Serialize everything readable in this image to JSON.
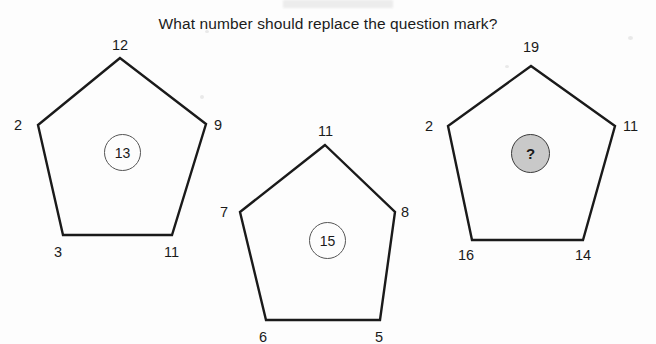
{
  "title": "What number should replace the question mark?",
  "colors": {
    "background": "#fdfdfd",
    "stroke": "#1a1a1a",
    "question_fill": "#c9c9c9",
    "text": "#1a1a1a"
  },
  "puzzle": {
    "type": "pentagon-number-puzzle",
    "shape_count": 3,
    "shapes": [
      {
        "name": "pentagon-1",
        "center_value": "13",
        "center_is_question": false,
        "vertices": {
          "top": "12",
          "left": "2",
          "right": "9",
          "bottom_left": "3",
          "bottom_right": "11"
        }
      },
      {
        "name": "pentagon-2",
        "center_value": "15",
        "center_is_question": false,
        "vertices": {
          "top": "11",
          "left": "7",
          "right": "8",
          "bottom_left": "6",
          "bottom_right": "5"
        }
      },
      {
        "name": "pentagon-3",
        "center_value": "?",
        "center_is_question": true,
        "vertices": {
          "top": "19",
          "left": "2",
          "right": "11",
          "bottom_left": "16",
          "bottom_right": "14"
        }
      }
    ]
  }
}
